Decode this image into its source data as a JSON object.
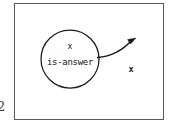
{
  "figure": {
    "margin_number": "2",
    "frame_color": "#5a5a5a",
    "ink_color": "#141414",
    "background": "#ffffff"
  },
  "node": {
    "name": "is-answer-node",
    "shape": "circle",
    "variable_label": "x",
    "predicate_label": "is-answer",
    "center_x": 70,
    "center_y": 59,
    "radius": 29
  },
  "edge": {
    "name": "curved-arrow",
    "from": "is-answer-node",
    "to": "target-variable",
    "start_x": 98,
    "start_y": 57,
    "ctrl_x": 118,
    "ctrl_y": 54,
    "end_x": 134,
    "end_y": 39,
    "arrowhead": "filled-triangle"
  },
  "target": {
    "name": "target-variable",
    "label": "x",
    "x": 131,
    "y": 69
  }
}
